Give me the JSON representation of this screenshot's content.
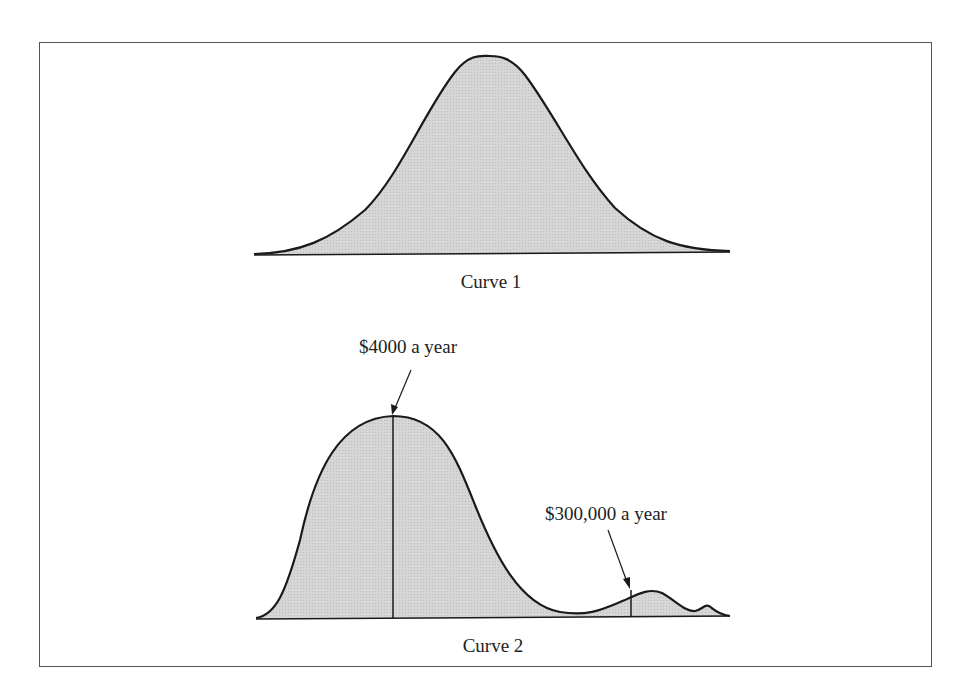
{
  "figure": {
    "curve1": {
      "caption": "Curve 1",
      "shape": "symmetric bell curve (normal distribution)"
    },
    "curve2": {
      "caption": "Curve 2",
      "shape": "right-skewed, bimodal distribution",
      "annotations": [
        {
          "label": "$4000 a year",
          "target": "main peak"
        },
        {
          "label": "$300,000 a year",
          "target": "secondary peak"
        }
      ]
    },
    "colors": {
      "fill": "#d4d4d4",
      "stroke": "#1a1a1a",
      "frame": "#555555"
    }
  }
}
